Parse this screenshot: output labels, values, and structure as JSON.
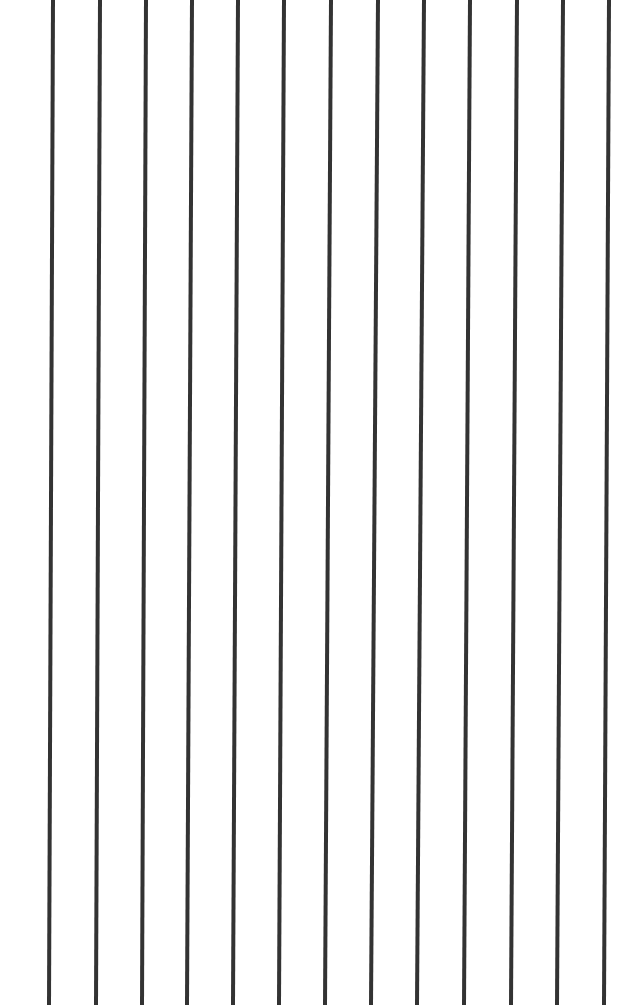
{
  "canvas": {
    "width": 620,
    "height": 1005,
    "background": "#ffffff"
  },
  "line_color": "#333333",
  "line_width": 4,
  "lines": [
    {
      "x_top": 53,
      "x_bottom": 49
    },
    {
      "x_top": 100,
      "x_bottom": 96
    },
    {
      "x_top": 146,
      "x_bottom": 142
    },
    {
      "x_top": 192,
      "x_bottom": 187
    },
    {
      "x_top": 238,
      "x_bottom": 233
    },
    {
      "x_top": 284,
      "x_bottom": 279
    },
    {
      "x_top": 331,
      "x_bottom": 325
    },
    {
      "x_top": 378,
      "x_bottom": 371
    },
    {
      "x_top": 424,
      "x_bottom": 417
    },
    {
      "x_top": 470,
      "x_bottom": 464
    },
    {
      "x_top": 517,
      "x_bottom": 511
    },
    {
      "x_top": 563,
      "x_bottom": 557
    },
    {
      "x_top": 609,
      "x_bottom": 604
    }
  ]
}
